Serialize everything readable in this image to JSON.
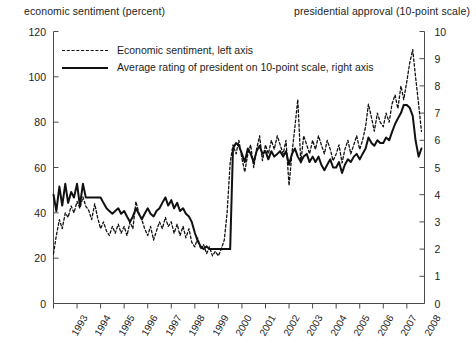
{
  "chart_data": {
    "type": "line",
    "title": "",
    "left_axis_title": "economic sentiment (percent)",
    "right_axis_title": "presidential approval (10-point scale)",
    "xlabel": "",
    "grid": false,
    "legend_position": "top-left-inside",
    "xlim": [
      1993,
      2008.75
    ],
    "ylim_left": [
      0,
      120
    ],
    "ylim_right": [
      0,
      10
    ],
    "left_ticks": [
      0,
      20,
      40,
      60,
      80,
      100,
      120
    ],
    "right_ticks": [
      0,
      1,
      2,
      3,
      4,
      5,
      6,
      7,
      8,
      9,
      10
    ],
    "xticks": [
      1993,
      1994,
      1995,
      1996,
      1997,
      1998,
      1999,
      2000,
      2001,
      2002,
      2003,
      2004,
      2005,
      2006,
      2007,
      2008
    ],
    "xtick_labels": [
      "1993",
      "1994",
      "1995",
      "1996",
      "1997",
      "1998",
      "1999",
      "2000",
      "2001",
      "2002",
      "2003",
      "2004",
      "2005",
      "2006",
      "2007",
      "2008"
    ],
    "series": [
      {
        "name": "Economic sentiment, left axis",
        "legend_label": "Economic sentiment, left axis",
        "axis": "left",
        "style": "dashed",
        "color": "#111111",
        "x": [
          1993.0,
          1993.12,
          1993.25,
          1993.37,
          1993.5,
          1993.62,
          1993.75,
          1993.87,
          1994.0,
          1994.12,
          1994.25,
          1994.37,
          1994.5,
          1994.62,
          1994.75,
          1994.87,
          1995.0,
          1995.12,
          1995.25,
          1995.37,
          1995.5,
          1995.62,
          1995.75,
          1995.87,
          1996.0,
          1996.12,
          1996.25,
          1996.37,
          1996.5,
          1996.62,
          1996.75,
          1996.87,
          1997.0,
          1997.12,
          1997.25,
          1997.37,
          1997.5,
          1997.62,
          1997.75,
          1997.87,
          1998.0,
          1998.12,
          1998.25,
          1998.37,
          1998.5,
          1998.62,
          1998.75,
          1998.87,
          1999.0,
          1999.12,
          1999.25,
          1999.37,
          1999.5,
          1999.62,
          1999.75,
          1999.87,
          2000.0,
          2000.12,
          2000.25,
          2000.37,
          2000.5,
          2000.62,
          2000.75,
          2000.87,
          2001.0,
          2001.12,
          2001.25,
          2001.37,
          2001.5,
          2001.62,
          2001.75,
          2001.87,
          2002.0,
          2002.12,
          2002.25,
          2002.37,
          2002.5,
          2002.62,
          2002.75,
          2002.87,
          2003.0,
          2003.12,
          2003.25,
          2003.37,
          2003.5,
          2003.62,
          2003.75,
          2003.87,
          2004.0,
          2004.12,
          2004.25,
          2004.37,
          2004.5,
          2004.62,
          2004.75,
          2004.87,
          2005.0,
          2005.12,
          2005.25,
          2005.37,
          2005.5,
          2005.62,
          2005.75,
          2005.87,
          2006.0,
          2006.12,
          2006.25,
          2006.37,
          2006.5,
          2006.62,
          2006.75,
          2006.87,
          2007.0,
          2007.12,
          2007.25,
          2007.37,
          2007.5,
          2007.62,
          2007.75,
          2007.87,
          2008.0,
          2008.12,
          2008.25,
          2008.37,
          2008.5,
          2008.62
        ],
        "values": [
          22,
          30,
          37,
          33,
          40,
          38,
          43,
          40,
          45,
          42,
          47,
          43,
          41,
          37,
          44,
          38,
          33,
          36,
          32,
          30,
          34,
          31,
          35,
          31,
          34,
          30,
          36,
          33,
          45,
          40,
          37,
          33,
          30,
          34,
          28,
          32,
          36,
          33,
          38,
          34,
          36,
          31,
          35,
          30,
          34,
          29,
          33,
          27,
          25,
          29,
          24,
          26,
          22,
          25,
          21,
          23,
          21,
          24,
          28,
          40,
          62,
          70,
          66,
          72,
          64,
          58,
          66,
          70,
          60,
          68,
          74,
          63,
          70,
          66,
          72,
          68,
          74,
          70,
          66,
          72,
          52,
          66,
          78,
          90,
          62,
          74,
          70,
          66,
          72,
          68,
          74,
          70,
          66,
          72,
          68,
          63,
          66,
          70,
          62,
          68,
          72,
          66,
          70,
          74,
          68,
          72,
          78,
          88,
          82,
          76,
          84,
          80,
          78,
          84,
          80,
          88,
          92,
          86,
          96,
          90,
          98,
          106,
          112,
          100,
          88,
          76
        ]
      },
      {
        "name": "Average rating of president on 10-point scale, right axis",
        "legend_label": "Average rating of president on 10-point scale, right axis",
        "axis": "right",
        "style": "solid",
        "color": "#111111",
        "x": [
          1993.0,
          1993.12,
          1993.25,
          1993.37,
          1993.5,
          1993.62,
          1993.75,
          1993.87,
          1994.0,
          1994.12,
          1994.25,
          1994.37,
          1994.5,
          1994.62,
          1994.75,
          1994.87,
          1995.0,
          1995.12,
          1995.25,
          1995.37,
          1995.5,
          1995.62,
          1995.75,
          1995.87,
          1996.0,
          1996.12,
          1996.25,
          1996.37,
          1996.5,
          1996.62,
          1996.75,
          1996.87,
          1997.0,
          1997.12,
          1997.25,
          1997.37,
          1997.5,
          1997.62,
          1997.75,
          1997.87,
          1998.0,
          1998.12,
          1998.25,
          1998.37,
          1998.5,
          1998.62,
          1998.75,
          1998.87,
          1999.0,
          1999.12,
          1999.25,
          1999.37,
          1999.5,
          1999.62,
          1999.75,
          1999.87,
          2000.0,
          2000.12,
          2000.25,
          2000.37,
          2000.5,
          2000.62,
          2000.75,
          2000.87,
          2001.0,
          2001.12,
          2001.25,
          2001.37,
          2001.5,
          2001.62,
          2001.75,
          2001.87,
          2002.0,
          2002.12,
          2002.25,
          2002.37,
          2002.5,
          2002.62,
          2002.75,
          2002.87,
          2003.0,
          2003.12,
          2003.25,
          2003.37,
          2003.5,
          2003.62,
          2003.75,
          2003.87,
          2004.0,
          2004.12,
          2004.25,
          2004.37,
          2004.5,
          2004.62,
          2004.75,
          2004.87,
          2005.0,
          2005.12,
          2005.25,
          2005.37,
          2005.5,
          2005.62,
          2005.75,
          2005.87,
          2006.0,
          2006.12,
          2006.25,
          2006.37,
          2006.5,
          2006.62,
          2006.75,
          2006.87,
          2007.0,
          2007.12,
          2007.25,
          2007.37,
          2007.5,
          2007.62,
          2007.75,
          2007.87,
          2008.0,
          2008.12,
          2008.25,
          2008.37,
          2008.5,
          2008.62
        ],
        "values": [
          4.0,
          3.4,
          4.3,
          3.6,
          4.4,
          3.7,
          4.1,
          3.9,
          4.4,
          3.6,
          4.4,
          3.9,
          3.9,
          3.9,
          3.9,
          3.9,
          3.9,
          3.7,
          3.5,
          3.4,
          3.3,
          3.4,
          3.5,
          3.3,
          3.4,
          3.2,
          3.0,
          3.2,
          3.5,
          3.3,
          3.1,
          3.3,
          3.5,
          3.3,
          3.2,
          3.4,
          3.5,
          3.7,
          3.9,
          3.6,
          3.8,
          3.5,
          3.7,
          3.4,
          3.5,
          3.3,
          3.2,
          3.0,
          2.6,
          2.3,
          2.1,
          2.0,
          2.1,
          2.0,
          2.0,
          2.0,
          2.0,
          2.0,
          2.0,
          2.0,
          2.0,
          5.7,
          5.9,
          5.8,
          5.5,
          5.2,
          5.7,
          5.5,
          5.2,
          5.6,
          5.8,
          5.5,
          5.6,
          5.3,
          5.6,
          5.4,
          5.5,
          5.6,
          5.4,
          5.6,
          5.1,
          5.5,
          5.7,
          5.4,
          5.2,
          5.4,
          5.5,
          5.2,
          5.4,
          5.2,
          5.4,
          5.1,
          4.9,
          5.1,
          5.3,
          5.0,
          5.0,
          5.2,
          4.8,
          5.1,
          5.3,
          5.2,
          5.4,
          5.5,
          5.3,
          5.5,
          5.7,
          6.1,
          5.9,
          5.8,
          6.0,
          5.9,
          5.9,
          6.1,
          6.0,
          6.3,
          6.6,
          6.8,
          7.0,
          7.3,
          7.3,
          7.2,
          6.9,
          6.0,
          5.4,
          5.7
        ]
      }
    ]
  }
}
